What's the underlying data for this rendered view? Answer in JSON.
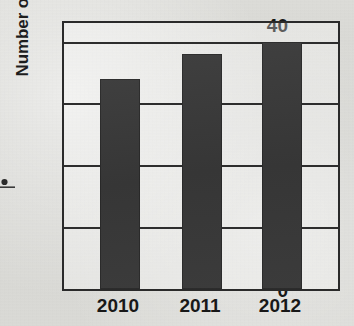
{
  "chart_data": {
    "type": "bar",
    "title": "",
    "xlabel": "",
    "ylabel": "Number of students",
    "categories": [
      "2010",
      "2011",
      "2012"
    ],
    "values": [
      34,
      38,
      40
    ],
    "ylim": [
      0,
      43
    ],
    "yticks": [
      0,
      10,
      20,
      30,
      40
    ],
    "ytick_labels": [
      "0",
      "10",
      "20",
      "30",
      "40"
    ],
    "grid": true,
    "legend": false,
    "legend_position": "none",
    "series": [
      {
        "name": "Number of students",
        "values": [
          34,
          38,
          40
        ]
      }
    ],
    "bar_color": "#3a3a3a",
    "axis_color": "#2a2a2a"
  },
  "figure": {
    "background_color": "#d9d9d6",
    "marks": {
      "stray_ink_dot": "stray-ink-dot"
    }
  }
}
